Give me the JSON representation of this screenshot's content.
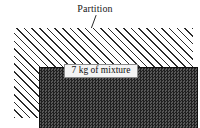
{
  "figure": {
    "background_color": "#ffffff"
  },
  "annotations": {
    "partition": {
      "label": "Partition",
      "points_to": "top-wall"
    }
  },
  "container": {
    "wall_style": "diagonal-hatching",
    "wall_color": "#2b2b2b",
    "description": "insulated rigid boundary"
  },
  "contents": {
    "fill_style": "dark-stipple",
    "fill_color": "#3b3b3b",
    "label": "7 kg of mixture",
    "mass": "7 kg",
    "substance": "mixture"
  }
}
